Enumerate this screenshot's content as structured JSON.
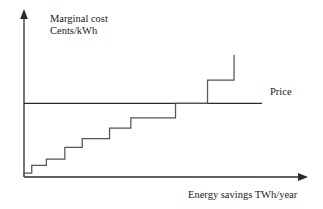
{
  "chart_data": {
    "type": "line",
    "subtype": "step",
    "title": "",
    "xlabel": "Energy savings TWh/year",
    "ylabel_lines": [
      "Marginal cost",
      "Cents/kWh"
    ],
    "ylabel": "Marginal cost Cents/kWh",
    "axes": {
      "x_axis_arrow": true,
      "y_axis_arrow": true,
      "grid": false,
      "tick_labels_x": [],
      "tick_labels_y": [],
      "xlim": [
        0,
        10
      ],
      "ylim": [
        0,
        10
      ]
    },
    "annotations": [
      {
        "name": "price-line",
        "label": "Price",
        "type": "horizontal-line",
        "y": 4.6,
        "color": "#2b2b2b"
      }
    ],
    "legend": {
      "position": "right-of-price-line",
      "entries": [
        "Price"
      ]
    },
    "series": [
      {
        "name": "Marginal cost supply curve",
        "type": "step",
        "color": "#555555",
        "steps": [
          {
            "index": 1,
            "x_start": 0.0,
            "x_end": 0.28,
            "y": 0.25
          },
          {
            "index": 2,
            "x_start": 0.28,
            "x_end": 0.81,
            "y": 0.72
          },
          {
            "index": 3,
            "x_start": 0.81,
            "x_end": 1.48,
            "y": 1.12
          },
          {
            "index": 4,
            "x_start": 1.48,
            "x_end": 2.11,
            "y": 1.85
          },
          {
            "index": 5,
            "x_start": 2.11,
            "x_end": 3.1,
            "y": 2.4
          },
          {
            "index": 6,
            "x_start": 3.1,
            "x_end": 3.87,
            "y": 3.05
          },
          {
            "index": 7,
            "x_start": 3.87,
            "x_end": 5.49,
            "y": 3.7
          },
          {
            "index": 8,
            "x_start": 5.49,
            "x_end": 6.65,
            "y": 4.6
          },
          {
            "index": 9,
            "x_start": 6.65,
            "x_end": 7.61,
            "y": 6.05
          },
          {
            "index": 10,
            "x_start": 7.61,
            "x_end": 7.63,
            "y": 7.6
          }
        ]
      }
    ]
  },
  "labels": {
    "y_axis_line1": "Marginal cost",
    "y_axis_line2": "Cents/kWh",
    "x_axis": "Energy savings TWh/year",
    "price": "Price"
  },
  "colors": {
    "axis": "#2b2b2b",
    "step_curve": "#555555",
    "price_line": "#2b2b2b",
    "background": "#ffffff",
    "text": "#1a1a1a"
  }
}
